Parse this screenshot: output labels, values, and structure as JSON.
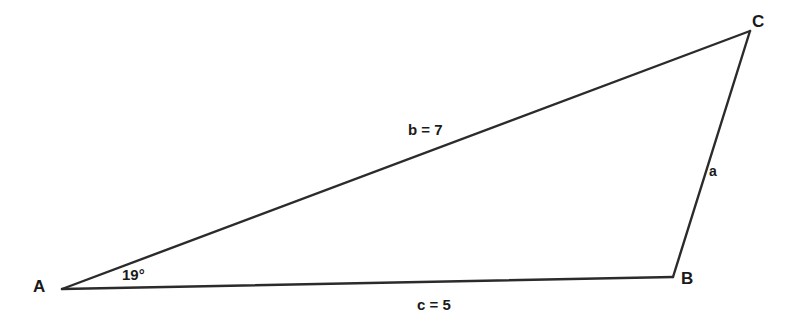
{
  "diagram": {
    "type": "triangle-geometry-figure",
    "background_color": "#ffffff",
    "stroke_color": "#2b2b2b",
    "vertices": {
      "a": {
        "label": "A",
        "x": 62,
        "y": 289
      },
      "b": {
        "label": "B",
        "x": 673,
        "y": 277
      },
      "c": {
        "label": "C",
        "x": 750,
        "y": 31
      }
    },
    "sides": {
      "a": {
        "label": "a",
        "from": "B",
        "to": "C"
      },
      "b": {
        "label": "b = 7",
        "from": "A",
        "to": "C",
        "value": 7
      },
      "c": {
        "label": "c = 5",
        "from": "A",
        "to": "B",
        "value": 5
      }
    },
    "angles": {
      "at_a": {
        "label": "19°",
        "value": 19,
        "unit": "degrees"
      }
    }
  }
}
